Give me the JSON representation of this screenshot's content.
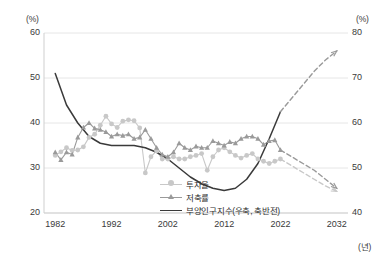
{
  "chart_data": {
    "type": "line",
    "title": "",
    "xlabel": "(년)",
    "ylabel_left": "(%)",
    "ylabel_right": "(%)",
    "x_ticks": [
      "1982",
      "1992",
      "2002",
      "2012",
      "2022",
      "2032"
    ],
    "x_tick_values": [
      1982,
      1992,
      2002,
      2012,
      2022,
      2032
    ],
    "xlim": [
      1980,
      2034
    ],
    "y_left_ticks": [
      "20",
      "30",
      "40",
      "50",
      "60"
    ],
    "y_left_tick_values": [
      20,
      30,
      40,
      50,
      60
    ],
    "ylim_left": [
      20,
      60
    ],
    "y_right_ticks": [
      "40",
      "50",
      "60",
      "70",
      "80"
    ],
    "y_right_tick_values": [
      40,
      50,
      60,
      70,
      80
    ],
    "ylim_right": [
      80,
      40
    ],
    "y_right_inverted": true,
    "grid": true,
    "legend_position": "bottom-right",
    "colors": {
      "investment_rate": "#c8c8c8",
      "savings_rate": "#9a9a9a",
      "dependency_index": "#3a3a3a",
      "grid": "#e6e6e6",
      "axis_text": "#3a3a3a"
    },
    "series": [
      {
        "name": "투자율",
        "axis": "left",
        "marker": "circle",
        "color": "#c8c8c8",
        "x": [
          1982,
          1983,
          1984,
          1985,
          1986,
          1987,
          1988,
          1989,
          1990,
          1991,
          1992,
          1993,
          1994,
          1995,
          1996,
          1997,
          1998,
          1999,
          2000,
          2001,
          2002,
          2003,
          2004,
          2005,
          2006,
          2007,
          2008,
          2009,
          2010,
          2011,
          2012,
          2013,
          2014,
          2015,
          2016,
          2017,
          2018,
          2019,
          2020,
          2021,
          2022
        ],
        "values": [
          32.8,
          33.6,
          34.5,
          33.9,
          34.0,
          34.7,
          36.8,
          37.5,
          39.5,
          41.5,
          39.8,
          39.0,
          40.4,
          40.7,
          40.5,
          38.9,
          28.9,
          32.5,
          33.8,
          32.0,
          32.0,
          32.5,
          32.0,
          32.0,
          32.5,
          32.8,
          33.2,
          29.5,
          32.5,
          34.0,
          34.5,
          33.6,
          32.8,
          32.2,
          32.8,
          33.2,
          32.0,
          31.5,
          31.0,
          31.5,
          32.0
        ]
      },
      {
        "name": "저축률",
        "axis": "left",
        "marker": "triangle",
        "color": "#9a9a9a",
        "x": [
          1982,
          1983,
          1984,
          1985,
          1986,
          1987,
          1988,
          1989,
          1990,
          1991,
          1992,
          1993,
          1994,
          1995,
          1996,
          1997,
          1998,
          1999,
          2000,
          2001,
          2002,
          2003,
          2004,
          2005,
          2006,
          2007,
          2008,
          2009,
          2010,
          2011,
          2012,
          2013,
          2014,
          2015,
          2016,
          2017,
          2018,
          2019,
          2020,
          2021,
          2022
        ],
        "values": [
          33.5,
          31.8,
          33.5,
          33.0,
          36.8,
          39.0,
          40.0,
          38.8,
          38.5,
          38.0,
          37.0,
          37.5,
          37.2,
          37.5,
          36.5,
          36.8,
          38.5,
          36.5,
          34.5,
          33.0,
          32.5,
          33.5,
          35.5,
          34.5,
          34.0,
          34.8,
          34.5,
          34.5,
          36.0,
          35.5,
          35.0,
          35.8,
          35.5,
          36.5,
          37.0,
          37.0,
          36.5,
          35.2,
          36.0,
          36.2,
          34.0
        ]
      },
      {
        "name": "부양인구지수(우축, 축반전)",
        "axis": "right",
        "marker": "none",
        "color": "#3a3a3a",
        "x": [
          1982,
          1984,
          1986,
          1988,
          1990,
          1992,
          1994,
          1996,
          1998,
          2000,
          2002,
          2004,
          2006,
          2008,
          2010,
          2012,
          2014,
          2016,
          2018,
          2020,
          2022
        ],
        "values": [
          71.0,
          64.0,
          60.0,
          57.0,
          55.5,
          55.0,
          55.0,
          55.0,
          54.5,
          53.5,
          52.0,
          50.0,
          48.0,
          46.5,
          45.5,
          45.0,
          45.5,
          47.5,
          51.0,
          56.5,
          62.5
        ]
      }
    ],
    "projections": [
      {
        "name": "투자율 (전망)",
        "style": "dashed",
        "color": "#c8c8c8",
        "x": [
          2022,
          2024,
          2026,
          2028,
          2030,
          2032
        ],
        "values": [
          32.0,
          30.5,
          29.0,
          27.5,
          26.0,
          24.8
        ]
      },
      {
        "name": "저축률 (전망)",
        "style": "dashed",
        "color": "#9a9a9a",
        "x": [
          2022,
          2024,
          2026,
          2028,
          2030,
          2032
        ],
        "values": [
          34.0,
          32.5,
          31.0,
          29.5,
          27.5,
          25.5
        ]
      },
      {
        "name": "부양인구지수 (전망)",
        "style": "dashed",
        "color": "#9a9a9a",
        "x": [
          2022,
          2024,
          2026,
          2028,
          2030,
          2032
        ],
        "values": [
          62.5,
          65.5,
          68.5,
          71.5,
          74.0,
          76.0
        ]
      }
    ]
  },
  "legend": {
    "items": [
      {
        "label": "투자율",
        "marker": "circle",
        "color": "#c8c8c8"
      },
      {
        "label": "저축률",
        "marker": "triangle",
        "color": "#9a9a9a"
      },
      {
        "label": "부양인구지수(우축, 축반전)",
        "marker": "line",
        "color": "#3a3a3a"
      }
    ]
  },
  "axes": {
    "left_unit": "(%)",
    "right_unit": "(%)",
    "x_unit": "(년)"
  }
}
